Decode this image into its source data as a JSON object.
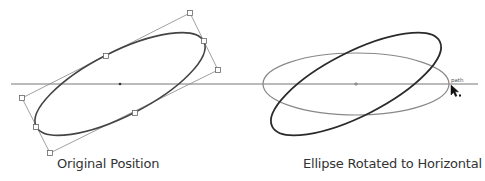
{
  "panels": [
    {
      "id": "original",
      "caption": "Original Position",
      "ellipse": {
        "cx": 120,
        "cy": 84,
        "rx": 94,
        "ry": 32,
        "rotation_deg": -27,
        "stroke": "#444444"
      },
      "bounding_box": [
        [
          190,
          13
        ],
        [
          218,
          70
        ],
        [
          50,
          153
        ],
        [
          22,
          98
        ]
      ],
      "handles": [
        [
          190,
          13
        ],
        [
          204,
          41
        ],
        [
          218,
          70
        ],
        [
          106,
          56
        ],
        [
          135,
          113
        ],
        [
          22,
          98
        ],
        [
          36,
          127
        ],
        [
          50,
          153
        ]
      ],
      "center_point": [
        120,
        84
      ]
    },
    {
      "id": "rotated",
      "caption": "Ellipse Rotated to Horizontal",
      "rotated_ellipse": {
        "cx": 356,
        "cy": 84,
        "rx": 94,
        "ry": 32,
        "rotation_deg": -27,
        "stroke": "#2a2a2a"
      },
      "horizontal_ellipse": {
        "cx": 356,
        "cy": 84,
        "rx": 93,
        "ry": 31,
        "rotation_deg": 0,
        "stroke": "#888888"
      },
      "center_point": [
        356,
        84
      ],
      "cursor_label": "path"
    }
  ],
  "horizontal_line": {
    "x1": 11,
    "x2": 478,
    "y": 84,
    "color": "#777777"
  },
  "colors": {
    "line": "#777777",
    "ellipse": "#3a3a3a",
    "handle_fill": "#ffffff",
    "handle_stroke": "#666666",
    "caption": "#333333"
  }
}
